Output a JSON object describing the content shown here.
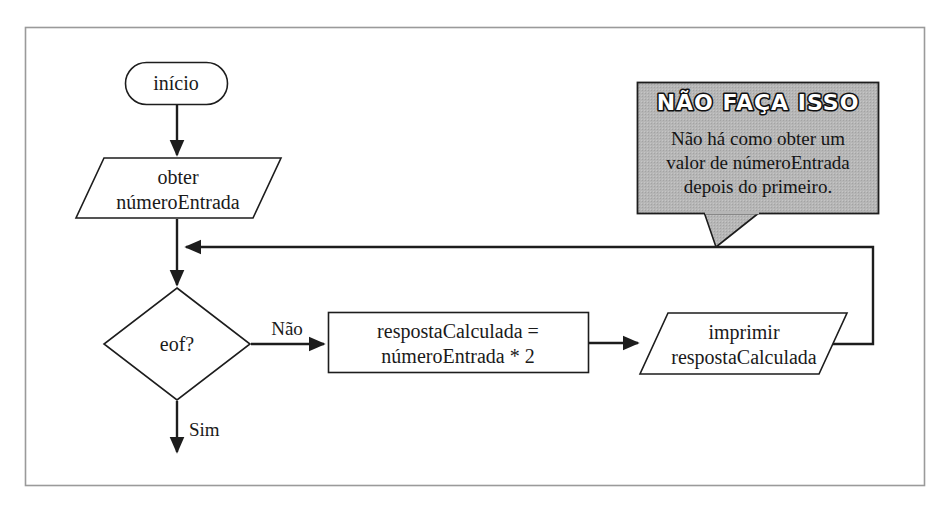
{
  "figure": {
    "language": "pt-BR",
    "frame": {
      "stroke": "#9a9a9a",
      "fill": "#ffffff"
    },
    "line_color": "#1d1d1d",
    "text_color": "#1a1a1a"
  },
  "nodes": {
    "start": {
      "type": "terminator",
      "label": "início"
    },
    "input": {
      "type": "input-output",
      "line1": "obter",
      "line2": "númeroEntrada"
    },
    "decision": {
      "type": "decision",
      "label": "eof?"
    },
    "process": {
      "type": "process",
      "line1": "respostaCalculada =",
      "line2": "númeroEntrada * 2"
    },
    "output": {
      "type": "input-output",
      "line1": "imprimir",
      "line2": "respostaCalculada"
    }
  },
  "edges": {
    "start_to_input": {
      "label": ""
    },
    "input_to_decision": {
      "label": ""
    },
    "decision_no": {
      "label": "Não"
    },
    "decision_yes": {
      "label": "Sim"
    },
    "process_to_output": {
      "label": ""
    },
    "loop_back": {
      "label": ""
    }
  },
  "callout": {
    "title": "NÃO FAÇA ISSO",
    "body_lines": [
      "Não há como obter um",
      "valor de númeroEntrada",
      "depois do primeiro."
    ],
    "fill": "#b4b4b4",
    "stroke": "#1d1d1d",
    "title_fill": "#ffffff",
    "title_stroke": "#111111"
  }
}
